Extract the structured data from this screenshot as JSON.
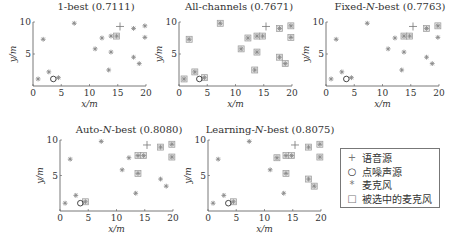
{
  "chart_data": [
    {
      "type": "scatter",
      "title": "1-best (0.7111)",
      "xlabel": "x/m",
      "ylabel": "y/m",
      "xlim": [
        0,
        20
      ],
      "ylim": [
        0,
        10
      ],
      "xticks": [
        0,
        5,
        10,
        15,
        20
      ],
      "yticks": [
        5,
        10
      ],
      "speech_source": [
        15.4,
        9.3
      ],
      "noise_source": [
        3.6,
        1.1
      ],
      "microphones": [
        [
          0.9,
          1.1
        ],
        [
          1.8,
          7.3
        ],
        [
          2.8,
          2.2
        ],
        [
          4.5,
          1.3
        ],
        [
          7.3,
          9.8
        ],
        [
          11.0,
          5.8
        ],
        [
          12.2,
          7.5
        ],
        [
          13.4,
          2.5
        ],
        [
          13.8,
          7.8
        ],
        [
          14.8,
          7.8
        ],
        [
          13.8,
          5.3
        ],
        [
          17.8,
          9.0
        ],
        [
          17.8,
          4.5
        ],
        [
          18.8,
          3.5
        ],
        [
          19.8,
          9.4
        ],
        [
          19.8,
          7.6
        ]
      ],
      "selected": [
        [
          14.8,
          7.8
        ]
      ]
    },
    {
      "type": "scatter",
      "title": "All-channels (0.7671)",
      "xlabel": "x/m",
      "ylabel": "y/m",
      "xlim": [
        0,
        20
      ],
      "ylim": [
        0,
        10
      ],
      "xticks": [
        0,
        5,
        10,
        15,
        20
      ],
      "yticks": [
        5,
        10
      ],
      "speech_source": [
        15.4,
        9.3
      ],
      "noise_source": [
        3.6,
        1.1
      ],
      "microphones": [
        [
          0.9,
          1.1
        ],
        [
          1.8,
          7.3
        ],
        [
          2.8,
          2.2
        ],
        [
          4.5,
          1.3
        ],
        [
          7.3,
          9.8
        ],
        [
          11.0,
          5.8
        ],
        [
          12.2,
          7.5
        ],
        [
          13.4,
          2.5
        ],
        [
          13.8,
          7.8
        ],
        [
          14.8,
          7.8
        ],
        [
          13.8,
          5.3
        ],
        [
          17.8,
          9.0
        ],
        [
          17.8,
          4.5
        ],
        [
          18.8,
          3.5
        ],
        [
          19.8,
          9.4
        ],
        [
          19.8,
          7.6
        ]
      ],
      "selected": "all"
    },
    {
      "type": "scatter",
      "title": "Fixed-N-best (0.7763)",
      "xlabel": "x/m",
      "ylabel": "y/m",
      "xlim": [
        0,
        20
      ],
      "ylim": [
        0,
        10
      ],
      "xticks": [
        0,
        5,
        10,
        15,
        20
      ],
      "yticks": [
        5,
        10
      ],
      "speech_source": [
        15.4,
        9.3
      ],
      "noise_source": [
        3.6,
        1.1
      ],
      "microphones": [
        [
          0.9,
          1.1
        ],
        [
          1.8,
          7.3
        ],
        [
          2.8,
          2.2
        ],
        [
          4.5,
          1.3
        ],
        [
          7.3,
          9.8
        ],
        [
          11.0,
          5.8
        ],
        [
          12.2,
          7.5
        ],
        [
          13.4,
          2.5
        ],
        [
          13.8,
          7.8
        ],
        [
          14.8,
          7.8
        ],
        [
          13.8,
          5.3
        ],
        [
          17.8,
          9.0
        ],
        [
          17.8,
          4.5
        ],
        [
          18.8,
          3.5
        ],
        [
          19.8,
          9.4
        ],
        [
          19.8,
          7.6
        ]
      ],
      "selected": [
        [
          13.8,
          7.8
        ],
        [
          14.8,
          7.8
        ],
        [
          17.8,
          9.0
        ],
        [
          19.8,
          9.4
        ]
      ]
    },
    {
      "type": "scatter",
      "title": "Auto-N-best (0.8080)",
      "xlabel": "x/m",
      "ylabel": "y/m",
      "xlim": [
        0,
        20
      ],
      "ylim": [
        0,
        10
      ],
      "xticks": [
        0,
        5,
        10,
        15,
        20
      ],
      "yticks": [
        5,
        10
      ],
      "speech_source": [
        15.4,
        9.3
      ],
      "noise_source": [
        3.6,
        1.1
      ],
      "microphones": [
        [
          0.9,
          1.1
        ],
        [
          1.8,
          7.3
        ],
        [
          2.8,
          2.2
        ],
        [
          4.5,
          1.3
        ],
        [
          7.3,
          9.8
        ],
        [
          11.0,
          5.8
        ],
        [
          12.2,
          7.5
        ],
        [
          13.4,
          2.5
        ],
        [
          13.8,
          7.8
        ],
        [
          14.8,
          7.8
        ],
        [
          13.8,
          5.3
        ],
        [
          17.8,
          9.0
        ],
        [
          17.8,
          4.5
        ],
        [
          18.8,
          3.5
        ],
        [
          19.8,
          9.4
        ],
        [
          19.8,
          7.6
        ]
      ],
      "selected": [
        [
          4.5,
          1.3
        ],
        [
          13.8,
          7.8
        ],
        [
          14.8,
          7.8
        ],
        [
          13.8,
          5.3
        ],
        [
          17.8,
          9.0
        ],
        [
          19.8,
          9.4
        ],
        [
          19.8,
          7.6
        ]
      ]
    },
    {
      "type": "scatter",
      "title": "Learning-N-best (0.8075)",
      "xlabel": "x/m",
      "ylabel": "y/m",
      "xlim": [
        0,
        20
      ],
      "ylim": [
        0,
        10
      ],
      "xticks": [
        0,
        5,
        10,
        15,
        20
      ],
      "yticks": [
        5,
        10
      ],
      "speech_source": [
        15.4,
        9.3
      ],
      "noise_source": [
        3.6,
        1.1
      ],
      "microphones": [
        [
          0.9,
          1.1
        ],
        [
          1.8,
          7.3
        ],
        [
          2.8,
          2.2
        ],
        [
          4.5,
          1.3
        ],
        [
          7.3,
          9.8
        ],
        [
          11.0,
          5.8
        ],
        [
          12.2,
          7.5
        ],
        [
          13.4,
          2.5
        ],
        [
          13.8,
          7.8
        ],
        [
          14.8,
          7.8
        ],
        [
          13.8,
          5.3
        ],
        [
          17.8,
          9.0
        ],
        [
          17.8,
          4.5
        ],
        [
          18.8,
          3.5
        ],
        [
          19.8,
          9.4
        ],
        [
          19.8,
          7.6
        ]
      ],
      "selected": [
        [
          4.5,
          1.3
        ],
        [
          12.2,
          7.5
        ],
        [
          13.8,
          7.8
        ],
        [
          14.8,
          7.8
        ],
        [
          13.8,
          5.3
        ],
        [
          17.8,
          9.0
        ],
        [
          17.8,
          4.5
        ],
        [
          18.8,
          3.5
        ],
        [
          19.8,
          9.4
        ],
        [
          19.8,
          7.6
        ]
      ]
    }
  ],
  "panels": [
    {
      "title_pre": "1-best ",
      "title_it": "",
      "title_post": "(0.7111)"
    },
    {
      "title_pre": "All-channels ",
      "title_it": "",
      "title_post": "(0.7671)"
    },
    {
      "title_pre": "Fixed-",
      "title_it": "N",
      "title_post": "-best (0.7763)"
    },
    {
      "title_pre": "Auto-",
      "title_it": "N",
      "title_post": "-best (0.8080)"
    },
    {
      "title_pre": "Learning-",
      "title_it": "N",
      "title_post": "-best (0.8075)"
    }
  ],
  "axis": {
    "xlabel": "x/m",
    "ylabel": "y/m"
  },
  "legend": {
    "items": [
      {
        "symbol": "+",
        "label": "语音源"
      },
      {
        "symbol": "○",
        "label": "点噪声源"
      },
      {
        "symbol": "*",
        "label": "麦克风"
      },
      {
        "symbol": "□",
        "label": "被选中的麦克风"
      }
    ]
  },
  "colors": {
    "axis": "#555555",
    "marker": "#8a8a8a",
    "text": "#333333"
  }
}
